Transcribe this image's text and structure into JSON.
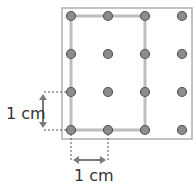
{
  "diagram": {
    "type": "geoboard",
    "grid": {
      "cols": 4,
      "rows": 4
    },
    "dots_x": [
      71,
      108,
      145,
      182
    ],
    "dots_y": [
      16,
      54,
      92,
      130
    ],
    "rectangle": {
      "x1": 71,
      "y1": 16,
      "x2": 145,
      "y2": 130
    },
    "labels": {
      "vertical": "1 cm",
      "horizontal": "1 cm"
    },
    "colors": {
      "frame": "#b0b0b0",
      "dot_fill": "#8c8c8c",
      "dot_stroke": "#555555",
      "shape": "#bdbdbd",
      "arrow": "#7a7a7a"
    }
  }
}
